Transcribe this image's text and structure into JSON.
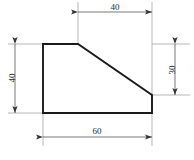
{
  "drawing": {
    "title": "Orthographic dimensioned profile view",
    "canvas": {
      "width": 194,
      "height": 160,
      "background": "#ffffff"
    },
    "colors": {
      "outline": "#1a1a1a",
      "dimension_line": "#555555",
      "extension_line": "#9a9a9a",
      "text": "#2b2b2b"
    },
    "shape": {
      "name": "right-trapezoid-profile",
      "vertices": [
        {
          "x": 43,
          "y": 44
        },
        {
          "x": 78,
          "y": 44
        },
        {
          "x": 152,
          "y": 95
        },
        {
          "x": 152,
          "y": 113
        },
        {
          "x": 43,
          "y": 113
        }
      ]
    },
    "dimensions": [
      {
        "name": "top-width",
        "label": "40",
        "orientation": "horizontal",
        "position": "top",
        "line": {
          "x1": 78,
          "y1": 12,
          "x2": 152,
          "y2": 12
        },
        "text_x": 115,
        "text_y": 10
      },
      {
        "name": "left-height",
        "label": "40",
        "orientation": "vertical",
        "position": "left",
        "line": {
          "x1": 15,
          "y1": 44,
          "x2": 15,
          "y2": 113
        },
        "text_x": 15,
        "text_y": 78
      },
      {
        "name": "right-height",
        "label": "30",
        "orientation": "vertical",
        "position": "right",
        "line": {
          "x1": 175,
          "y1": 44,
          "x2": 175,
          "y2": 95
        },
        "text_x": 175,
        "text_y": 70
      },
      {
        "name": "bottom-width",
        "label": "60",
        "orientation": "horizontal",
        "position": "bottom",
        "line": {
          "x1": 43,
          "y1": 137,
          "x2": 152,
          "y2": 137
        },
        "text_x": 97,
        "text_y": 134
      }
    ]
  }
}
